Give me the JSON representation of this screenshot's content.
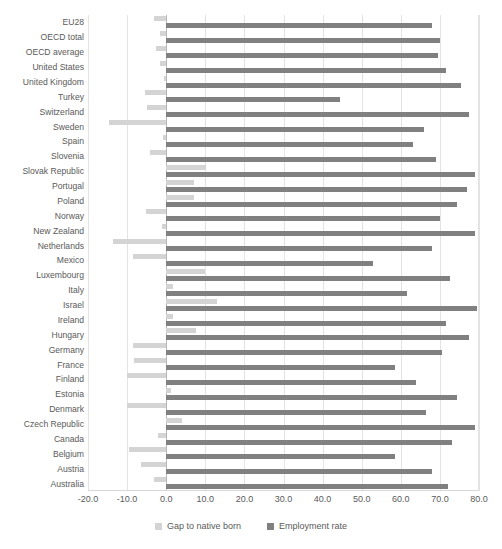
{
  "chart_data": {
    "type": "bar",
    "orientation": "horizontal",
    "title": "",
    "xlabel": "",
    "ylabel": "",
    "xlim": [
      -20.0,
      80.0
    ],
    "grid": true,
    "legend_position": "bottom",
    "xticks": [
      "-20.0",
      "-10.0",
      "0.0",
      "10.0",
      "20.0",
      "30.0",
      "40.0",
      "50.0",
      "60.0",
      "70.0",
      "80.0"
    ],
    "xtick_values": [
      -20,
      -10,
      0,
      10,
      20,
      30,
      40,
      50,
      60,
      70,
      80
    ],
    "categories": [
      "EU28",
      "OECD total",
      "OECD average",
      "United States",
      "United Kingdom",
      "Turkey",
      "Switzerland",
      "Sweden",
      "Spain",
      "Slovenia",
      "Slovak Republic",
      "Portugal",
      "Poland",
      "Norway",
      "New Zealand",
      "Netherlands",
      "Mexico",
      "Luxembourg",
      "Italy",
      "Israel",
      "Ireland",
      "Hungary",
      "Germany",
      "France",
      "Finland",
      "Estonia",
      "Denmark",
      "Czech Republic",
      "Canada",
      "Belgium",
      "Austria",
      "Australia"
    ],
    "series": [
      {
        "name": "Gap to native born",
        "color": "#d4d4d4",
        "values": [
          -3.0,
          -1.5,
          -2.5,
          -1.5,
          -0.6,
          -5.5,
          -5.0,
          -14.7,
          -0.7,
          -4.2,
          10.3,
          7.0,
          7.0,
          -5.2,
          -1.0,
          -13.7,
          -8.5,
          9.8,
          1.8,
          13.0,
          1.8,
          7.5,
          -8.5,
          -8.3,
          -10.0,
          1.2,
          -10.1,
          4.0,
          -2.0,
          -9.5,
          -6.5,
          -3.2
        ]
      },
      {
        "name": "Employment rate",
        "color": "#808080",
        "values": [
          68.0,
          70.0,
          69.5,
          71.5,
          75.5,
          44.5,
          77.5,
          66.0,
          63.0,
          69.0,
          79.0,
          77.0,
          74.5,
          70.0,
          79.0,
          68.0,
          53.0,
          72.5,
          61.5,
          79.5,
          71.5,
          77.5,
          70.5,
          58.5,
          64.0,
          74.5,
          66.5,
          79.0,
          73.0,
          58.5,
          68.0,
          72.0
        ]
      }
    ]
  },
  "legend": {
    "items": [
      {
        "label": "Gap to native born",
        "swatch": "gap"
      },
      {
        "label": "Employment rate",
        "swatch": "emp"
      }
    ]
  }
}
